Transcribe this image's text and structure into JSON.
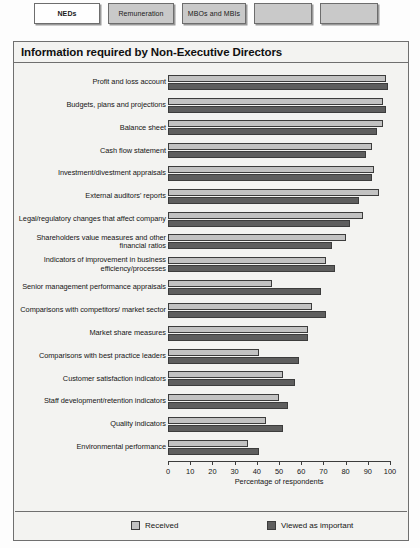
{
  "tabs": [
    {
      "label": "NEDs",
      "active": true
    },
    {
      "label": "Remuneration",
      "active": false
    },
    {
      "label": "MBOs and MBIs",
      "active": false
    },
    {
      "label": "",
      "active": false
    },
    {
      "label": "",
      "active": false
    }
  ],
  "panel": {
    "title": "Information required by Non-Executive Directors"
  },
  "legend": {
    "received_label": "Received",
    "important_label": "Viewed as important",
    "received_color": "#c2c2c2",
    "important_color": "#5e5e5e"
  },
  "chart_data": {
    "type": "bar",
    "orientation": "horizontal",
    "title": "Information required by Non-Executive Directors",
    "xlabel": "Percentage of respondents",
    "ylabel": "",
    "xlim": [
      0,
      100
    ],
    "xticks": [
      0,
      10,
      20,
      30,
      40,
      50,
      60,
      70,
      80,
      90,
      100
    ],
    "grid": false,
    "legend_position": "bottom",
    "categories": [
      "Profit and loss account",
      "Budgets, plans and projections",
      "Balance sheet",
      "Cash flow statement",
      "Investment/divestment appraisals",
      "External auditors' reports",
      "Legal/regulatory changes that affect company",
      "Shareholders value measures and other financial ratios",
      "Indicators of improvement in business efficiency/processes",
      "Senior management performance appraisals",
      "Comparisons with competitors/ market sector",
      "Market share measures",
      "Comparisons with best practice leaders",
      "Customer satisfaction indicators",
      "Staff development/retention indicators",
      "Quality indicators",
      "Environmental performance"
    ],
    "series": [
      {
        "name": "Received",
        "color": "#c2c2c2",
        "values": [
          98,
          97,
          97,
          92,
          93,
          95,
          88,
          80,
          71,
          47,
          65,
          63,
          41,
          52,
          50,
          44,
          36
        ]
      },
      {
        "name": "Viewed as important",
        "color": "#5e5e5e",
        "values": [
          99,
          98,
          94,
          89,
          92,
          86,
          82,
          74,
          75,
          69,
          71,
          63,
          59,
          57,
          54,
          52,
          41
        ]
      }
    ]
  }
}
